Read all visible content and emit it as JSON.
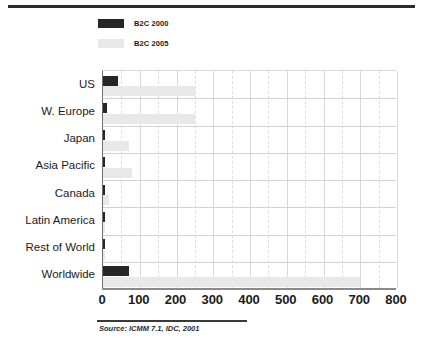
{
  "chart_data": {
    "type": "bar",
    "orientation": "horizontal",
    "title": "",
    "xlabel": "",
    "ylabel": "",
    "xlim": [
      0,
      800
    ],
    "xticks": [
      0,
      100,
      200,
      300,
      400,
      500,
      600,
      700,
      800
    ],
    "grid": true,
    "legend_position": "top-left",
    "categories": [
      "US",
      "W. Europe",
      "Japan",
      "Asia Pacific",
      "Canada",
      "Latin America",
      "Rest of World",
      "Worldwide"
    ],
    "series": [
      {
        "name": "B2C 2000",
        "color": "#262626",
        "values": [
          40,
          11,
          6,
          6,
          2,
          2,
          2,
          70
        ]
      },
      {
        "name": "B2C 2005",
        "color": "#e8e8e8",
        "values": [
          250,
          250,
          70,
          80,
          15,
          6,
          6,
          700
        ]
      }
    ],
    "annotations": {
      "source": "Source: ICMM 7.1, IDC, 2001"
    }
  },
  "legend": {
    "items": [
      {
        "label": "B2C 2000",
        "color": "#262626"
      },
      {
        "label": "B2C 2005",
        "color": "#e8e8e8"
      }
    ]
  },
  "footer": {
    "source": "Source: ICMM 7.1, IDC, 2001"
  }
}
